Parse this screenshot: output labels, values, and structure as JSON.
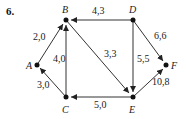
{
  "problem_number": "6.",
  "nodes": [
    {
      "id": "A",
      "label": "A",
      "x": 37,
      "y": 65
    },
    {
      "id": "B",
      "label": "B",
      "x": 66,
      "y": 20
    },
    {
      "id": "C",
      "label": "C",
      "x": 66,
      "y": 97
    },
    {
      "id": "D",
      "label": "D",
      "x": 133,
      "y": 20
    },
    {
      "id": "E",
      "label": "E",
      "x": 133,
      "y": 97
    },
    {
      "id": "F",
      "label": "F",
      "x": 166,
      "y": 65
    }
  ],
  "edges": [
    {
      "from": "A",
      "to": "B",
      "weight": "2,0"
    },
    {
      "from": "C",
      "to": "A",
      "weight": "3,0"
    },
    {
      "from": "C",
      "to": "B",
      "weight": "4,0"
    },
    {
      "from": "D",
      "to": "B",
      "weight": "4,3"
    },
    {
      "from": "B",
      "to": "E",
      "weight": "3,3"
    },
    {
      "from": "D",
      "to": "E",
      "weight": "5,5"
    },
    {
      "from": "E",
      "to": "C",
      "weight": "5,0"
    },
    {
      "from": "D",
      "to": "F",
      "weight": "6,6"
    },
    {
      "from": "E",
      "to": "F",
      "weight": "10,8"
    }
  ],
  "colors": {
    "edge": "#333333",
    "node": "#111111",
    "text": "#222222"
  }
}
